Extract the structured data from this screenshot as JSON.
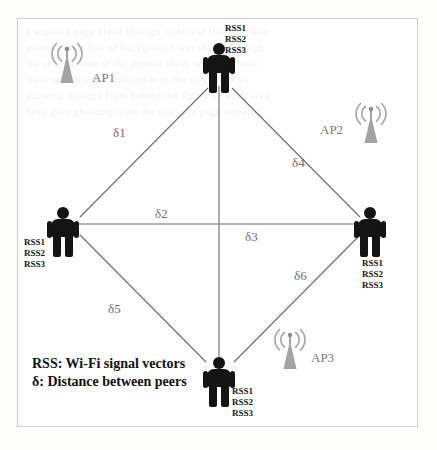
{
  "diagram": {
    "legend": {
      "line1": "RSS: Wi-Fi signal vectors",
      "line2": "δ: Distance between peers"
    },
    "colors": {
      "person": "#141414",
      "access_point": "#9a9a9a",
      "edge": "#6b6b6b",
      "label": "#6f6f6f",
      "frame": "#cfcfcf",
      "background": "#fefefe"
    },
    "peers": [
      {
        "id": "peer-top",
        "rss": [
          "RSS1",
          "RSS2",
          "RSS3"
        ],
        "rss_position": "above-right"
      },
      {
        "id": "peer-left",
        "rss": [
          "RSS1",
          "RSS2",
          "RSS3"
        ],
        "rss_position": "below-left"
      },
      {
        "id": "peer-right",
        "rss": [
          "RSS1",
          "RSS2",
          "RSS3"
        ],
        "rss_position": "below-left"
      },
      {
        "id": "peer-bottom",
        "rss": [
          "RSS1",
          "RSS2",
          "RSS3"
        ],
        "rss_position": "right"
      }
    ],
    "access_points": [
      {
        "id": "ap1",
        "label": "AP1",
        "label_side": "right"
      },
      {
        "id": "ap2",
        "label": "AP2",
        "label_side": "left"
      },
      {
        "id": "ap3",
        "label": "AP3",
        "label_side": "right"
      }
    ],
    "distances": [
      {
        "id": "d1",
        "label": "δ1",
        "between": [
          "peer-left",
          "peer-top"
        ]
      },
      {
        "id": "d2",
        "label": "δ2",
        "between": [
          "peer-left",
          "center"
        ]
      },
      {
        "id": "d3",
        "label": "δ3",
        "between": [
          "center",
          "peer-right"
        ]
      },
      {
        "id": "d4",
        "label": "δ4",
        "between": [
          "peer-top",
          "peer-right"
        ]
      },
      {
        "id": "d5",
        "label": "δ5",
        "between": [
          "peer-left",
          "peer-bottom"
        ]
      },
      {
        "id": "d6",
        "label": "δ6",
        "between": [
          "peer-bottom",
          "peer-right"
        ]
      }
    ],
    "bleed_text": {
      "l1": "a scanned page bleed through faint text line one here",
      "l2": "another faint line of background text shows through",
      "l3": "the reverse side of the printed sheet is visible here",
      "l4": "these characters are illegible in the original scan",
      "l5": "showing through from behind the figure artwork area",
      "l6": "faint grey ghosting from the opposite page surface"
    }
  }
}
